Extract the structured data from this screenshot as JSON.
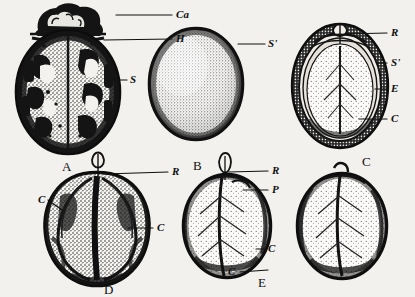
{
  "figure": {
    "type": "botanical-illustration-plate",
    "background_color": "#f2f1ee",
    "ink_color": "#101010",
    "panel_count": 5
  },
  "panels": [
    {
      "id": "A",
      "letter": "A",
      "name": "whole-seed-mottled-view",
      "letter_x": 62,
      "letter_y": 160,
      "shape": {
        "cx": 68,
        "cy": 92,
        "rx": 52,
        "ry": 62
      }
    },
    {
      "id": "B",
      "letter": "B",
      "name": "whole-seed-smooth-view",
      "letter_x": 193,
      "letter_y": 159,
      "shape": {
        "cx": 196,
        "cy": 84,
        "rx": 47,
        "ry": 56
      }
    },
    {
      "id": "C",
      "letter": "C",
      "name": "longitudinal-section-view",
      "letter_x": 362,
      "letter_y": 155,
      "shape": {
        "cx": 340,
        "cy": 85,
        "rx": 48,
        "ry": 62
      }
    },
    {
      "id": "D",
      "letter": "D",
      "name": "kernel-dorsal-view",
      "letter_x": 104,
      "letter_y": 283,
      "shape": {
        "cx": 97,
        "cy": 228,
        "rx": 50,
        "ry": 56
      }
    },
    {
      "id": "E",
      "letter": "E",
      "name": "cotyledon-face-view",
      "letter_x": 258,
      "letter_y": 276,
      "shape": {
        "cx": 227,
        "cy": 226,
        "rx": 44,
        "ry": 52
      }
    }
  ],
  "labels": [
    {
      "key": "Ca",
      "text": "Ca",
      "name": "label-calyx",
      "panel": "A",
      "text_x": 176,
      "text_y": 9,
      "leader": {
        "x1": 116,
        "y1": 15,
        "x2": 172,
        "y2": 15
      }
    },
    {
      "key": "H",
      "text": "H",
      "name": "label-hilum",
      "panel": "A",
      "text_x": 176,
      "text_y": 33,
      "leader": {
        "x1": 104,
        "y1": 40,
        "x2": 172,
        "y2": 39
      }
    },
    {
      "key": "S",
      "text": "S",
      "name": "label-seed-coat",
      "panel": "A",
      "text_x": 130,
      "text_y": 74,
      "leader": {
        "x1": 108,
        "y1": 80,
        "x2": 127,
        "y2": 80
      }
    },
    {
      "key": "Sprime_B",
      "text": "S'",
      "name": "label-outer-shell",
      "panel": "B",
      "text_x": 268,
      "text_y": 38,
      "leader": {
        "x1": 238,
        "y1": 44,
        "x2": 265,
        "y2": 44
      }
    },
    {
      "key": "R_C",
      "text": "R",
      "name": "label-radicle",
      "panel": "C",
      "text_x": 391,
      "text_y": 27,
      "leader": {
        "x1": 344,
        "y1": 34,
        "x2": 387,
        "y2": 33
      }
    },
    {
      "key": "Sprime_C",
      "text": "S'",
      "name": "label-shell-layer",
      "panel": "C",
      "text_x": 391,
      "text_y": 57,
      "leader": {
        "x1": 378,
        "y1": 63,
        "x2": 387,
        "y2": 63
      }
    },
    {
      "key": "E_C",
      "text": "E",
      "name": "label-endosperm",
      "panel": "C",
      "text_x": 391,
      "text_y": 83,
      "leader": {
        "x1": 375,
        "y1": 89,
        "x2": 387,
        "y2": 89
      }
    },
    {
      "key": "C_C",
      "text": "C",
      "name": "label-cotyledon",
      "panel": "C",
      "text_x": 391,
      "text_y": 113,
      "leader": {
        "x1": 359,
        "y1": 119,
        "x2": 387,
        "y2": 119
      }
    },
    {
      "key": "R_D",
      "text": "R",
      "name": "label-radicle",
      "panel": "D",
      "text_x": 172,
      "text_y": 166,
      "leader": {
        "x1": 104,
        "y1": 174,
        "x2": 168,
        "y2": 172
      }
    },
    {
      "key": "C_D_left",
      "text": "C",
      "name": "label-cotyledon",
      "panel": "D",
      "text_x": 38,
      "text_y": 194,
      "leader": {
        "x1": 48,
        "y1": 200,
        "x2": 62,
        "y2": 210
      }
    },
    {
      "key": "C_D_right",
      "text": "C",
      "name": "label-cotyledon",
      "panel": "D",
      "text_x": 157,
      "text_y": 222,
      "leader": {
        "x1": 128,
        "y1": 228,
        "x2": 153,
        "y2": 228
      }
    },
    {
      "key": "R_E",
      "text": "R",
      "name": "label-radicle",
      "panel": "E",
      "text_x": 272,
      "text_y": 165,
      "leader": {
        "x1": 228,
        "y1": 172,
        "x2": 268,
        "y2": 171
      }
    },
    {
      "key": "P_E",
      "text": "P",
      "name": "label-plumule",
      "panel": "E",
      "text_x": 272,
      "text_y": 184,
      "leader": {
        "x1": 243,
        "y1": 190,
        "x2": 268,
        "y2": 190
      }
    },
    {
      "key": "C_E_right",
      "text": "C",
      "name": "label-cotyledon",
      "panel": "E",
      "text_x": 268,
      "text_y": 243,
      "leader": {
        "x1": 256,
        "y1": 249,
        "x2": 264,
        "y2": 249
      }
    },
    {
      "key": "C_E_lower",
      "text": "C",
      "name": "label-cotyledon",
      "panel": "E",
      "text_x": 228,
      "text_y": 266,
      "leader": {
        "x1": 240,
        "y1": 272,
        "x2": 268,
        "y2": 270
      }
    }
  ]
}
